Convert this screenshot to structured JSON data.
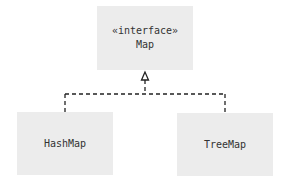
{
  "diagram": {
    "type": "uml-class",
    "nodes": [
      {
        "id": "map",
        "stereotype": "«interface»",
        "name": "Map"
      },
      {
        "id": "hashmap",
        "name": "HashMap"
      },
      {
        "id": "treemap",
        "name": "TreeMap"
      }
    ],
    "edges": [
      {
        "from": "hashmap",
        "to": "map",
        "kind": "realization",
        "style": "dashed",
        "arrowhead": "hollow-triangle"
      },
      {
        "from": "treemap",
        "to": "map",
        "kind": "realization",
        "style": "dashed",
        "arrowhead": "hollow-triangle"
      }
    ],
    "colors": {
      "box_fill": "#ececec",
      "text": "#333333",
      "line": "#222222",
      "background": "#ffffff"
    }
  }
}
